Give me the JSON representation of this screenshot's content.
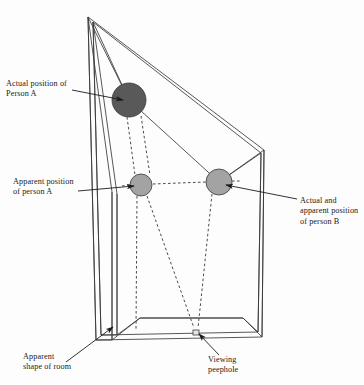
{
  "diagram": {
    "background_color": "#fdfdfd",
    "line_color": "#3a3a3a",
    "text_color": "#1b1b1b",
    "labels": {
      "actual_position_a": "Actual position of\nPerson A",
      "apparent_position_a": "Apparent position\nof person A",
      "actual_apparent_b": "Actual and\napparent position\nof person B",
      "apparent_shape": "Apparent\nshape of room",
      "viewing_peephole": "Viewing\npeephole"
    },
    "figures": [
      {
        "name": "person-a-actual",
        "cx": 129,
        "cy": 100,
        "r": 17,
        "fill": "#595959"
      },
      {
        "name": "person-a-apparent",
        "cx": 141,
        "cy": 185,
        "r": 11,
        "fill": "#a3a3a3"
      },
      {
        "name": "person-b",
        "cx": 219,
        "cy": 182,
        "r": 13,
        "fill": "#a3a3a3"
      }
    ],
    "peephole": {
      "x": 193,
      "y": 330,
      "width": 6,
      "height": 5
    }
  }
}
